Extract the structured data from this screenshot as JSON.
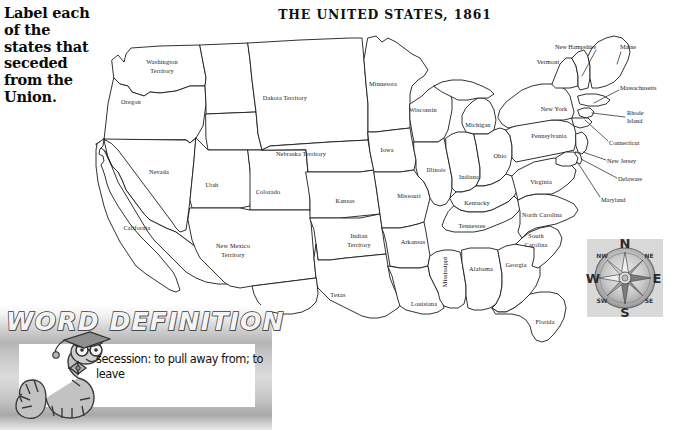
{
  "instruction": {
    "text": "Label each of the states that seceded from the Union."
  },
  "map": {
    "title": "THE UNITED STATES, 1861",
    "states": [
      {
        "name": "Washington Territory",
        "lines": [
          "Washington",
          "Territory"
        ],
        "x": 162,
        "y": 66
      },
      {
        "name": "Oregon",
        "lines": [
          "Oregon"
        ],
        "x": 131,
        "y": 102
      },
      {
        "name": "California",
        "lines": [
          "California"
        ],
        "x": 137,
        "y": 228
      },
      {
        "name": "Nevada",
        "lines": [
          "Nevada"
        ],
        "x": 159,
        "y": 172
      },
      {
        "name": "Utah",
        "lines": [
          "Utah"
        ],
        "x": 212,
        "y": 185
      },
      {
        "name": "Colorado",
        "lines": [
          "Colorado"
        ],
        "x": 268,
        "y": 192
      },
      {
        "name": "New Mexico Territory",
        "lines": [
          "New Mexico",
          "Territory"
        ],
        "x": 233,
        "y": 250
      },
      {
        "name": "Dakota Territory",
        "lines": [
          "Dakota Territory"
        ],
        "x": 285,
        "y": 98
      },
      {
        "name": "Nebraska Territory",
        "lines": [
          "Nebraska Territory"
        ],
        "x": 301,
        "y": 154
      },
      {
        "name": "Kansas",
        "lines": [
          "Kansas"
        ],
        "x": 345,
        "y": 201
      },
      {
        "name": "Indian Territory",
        "lines": [
          "Indian",
          "Territory"
        ],
        "x": 359,
        "y": 240
      },
      {
        "name": "Texas",
        "lines": [
          "Texas"
        ],
        "x": 338,
        "y": 295
      },
      {
        "name": "Minnesota",
        "lines": [
          "Minnesota"
        ],
        "x": 383,
        "y": 84
      },
      {
        "name": "Iowa",
        "lines": [
          "Iowa"
        ],
        "x": 387,
        "y": 150
      },
      {
        "name": "Missouri",
        "lines": [
          "Missouri"
        ],
        "x": 409,
        "y": 196
      },
      {
        "name": "Arkansas",
        "lines": [
          "Arkansas"
        ],
        "x": 413,
        "y": 242
      },
      {
        "name": "Louisiana",
        "lines": [
          "Louisiana"
        ],
        "x": 424,
        "y": 304
      },
      {
        "name": "Wisconsin",
        "lines": [
          "Wisconsin"
        ],
        "x": 423,
        "y": 110
      },
      {
        "name": "Illinois",
        "lines": [
          "Illinois"
        ],
        "x": 436,
        "y": 170
      },
      {
        "name": "Mississippi",
        "lines": [
          "Mississippi"
        ],
        "x": 445,
        "y": 272,
        "rotated": true
      },
      {
        "name": "Michigan",
        "lines": [
          "Michigan"
        ],
        "x": 478,
        "y": 125
      },
      {
        "name": "Indiana",
        "lines": [
          "Indiana"
        ],
        "x": 469,
        "y": 177
      },
      {
        "name": "Kentucky",
        "lines": [
          "Kentucky"
        ],
        "x": 477,
        "y": 203
      },
      {
        "name": "Tennessee",
        "lines": [
          "Tennessee"
        ],
        "x": 472,
        "y": 226
      },
      {
        "name": "Alabama",
        "lines": [
          "Alabama"
        ],
        "x": 481,
        "y": 269
      },
      {
        "name": "Ohio",
        "lines": [
          "Ohio"
        ],
        "x": 500,
        "y": 156
      },
      {
        "name": "Georgia",
        "lines": [
          "Georgia"
        ],
        "x": 516,
        "y": 265
      },
      {
        "name": "North Carolina",
        "lines": [
          "North Carolina"
        ],
        "x": 542,
        "y": 215
      },
      {
        "name": "South Carolina",
        "lines": [
          "South",
          "Carolina"
        ],
        "x": 536,
        "y": 240
      },
      {
        "name": "Florida",
        "lines": [
          "Florida"
        ],
        "x": 545,
        "y": 322
      },
      {
        "name": "Virginia",
        "lines": [
          "Virginia"
        ],
        "x": 541,
        "y": 182
      },
      {
        "name": "Pennsylvania",
        "lines": [
          "Pennsylvania"
        ],
        "x": 549,
        "y": 136
      },
      {
        "name": "New York",
        "lines": [
          "New York"
        ],
        "x": 554,
        "y": 109
      },
      {
        "name": "Vermont",
        "lines": [
          "Vermont"
        ],
        "x": 548,
        "y": 62
      }
    ],
    "callouts": [
      {
        "name": "New Hampshire",
        "lines": [
          "New Hampshire"
        ],
        "x": 596,
        "y": 47,
        "align": "right",
        "line": "M 596 50 L 582 76"
      },
      {
        "name": "Maine",
        "lines": [
          "Maine"
        ],
        "x": 620,
        "y": 47,
        "align": "left",
        "line": "M 621 52 L 617 64"
      },
      {
        "name": "Massachusetts",
        "lines": [
          "Massachusetts"
        ],
        "x": 620,
        "y": 88,
        "align": "left",
        "line": "M 619 90 L 594 103"
      },
      {
        "name": "Rhode Island",
        "lines": [
          "Rhode",
          "Island"
        ],
        "x": 627,
        "y": 117,
        "align": "left",
        "line": "M 625 117 L 592 113"
      },
      {
        "name": "Connecticut",
        "lines": [
          "Connecticut"
        ],
        "x": 609,
        "y": 143,
        "align": "left",
        "line": "M 608 141 L 585 120"
      },
      {
        "name": "New Jersey",
        "lines": [
          "New Jersey"
        ],
        "x": 607,
        "y": 161,
        "align": "left",
        "line": "M 606 160 L 583 152"
      },
      {
        "name": "Delaware",
        "lines": [
          "Delaware"
        ],
        "x": 618,
        "y": 179,
        "align": "left",
        "line": "M 617 178 L 581 159"
      },
      {
        "name": "Maryland",
        "lines": [
          "Maryland"
        ],
        "x": 601,
        "y": 200,
        "align": "left",
        "line": "M 600 197 L 578 163"
      }
    ]
  },
  "compass": {
    "n": "N",
    "s": "S",
    "e": "E",
    "w": "W",
    "nw": "NW",
    "ne": "NE",
    "sw": "SW",
    "se": "SE"
  },
  "word_definition": {
    "banner": "WORD DEFINITION",
    "term_and_meaning": "secession: to pull away from; to leave"
  },
  "colors": {
    "ink": "#1b1b1b",
    "paper": "#ffffff",
    "band_gray": "#b5b5b5"
  }
}
